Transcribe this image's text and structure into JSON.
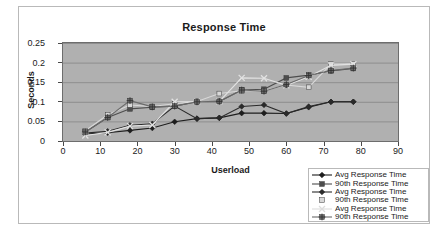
{
  "chart_data": {
    "type": "line",
    "title": "Response Time",
    "xlabel": "Userload",
    "ylabel": "Seconds",
    "xlim": [
      0,
      90
    ],
    "ylim": [
      0,
      0.25
    ],
    "xticks": [
      0,
      10,
      20,
      30,
      40,
      50,
      60,
      70,
      80,
      90
    ],
    "yticks": [
      0,
      0.05,
      0.1,
      0.15,
      0.2,
      0.25
    ],
    "ytick_labels": [
      "0",
      "0.05",
      "0.1",
      "0.15",
      "0.2",
      "0.25"
    ],
    "xtick_labels": [
      "0",
      "10",
      "20",
      "30",
      "40",
      "50",
      "60",
      "70",
      "80",
      "90"
    ],
    "grid": true,
    "plot_background": "#b0b0b0",
    "legend_position": "bottom-right",
    "x": [
      6,
      12,
      18,
      24,
      30,
      36,
      42,
      48,
      54,
      60,
      66,
      72,
      78
    ],
    "series": [
      {
        "name": "Avg Response Time",
        "marker": "diamond",
        "color": "#1d1d1d",
        "values": [
          0.018,
          0.021,
          0.027,
          0.033,
          0.049,
          0.057,
          0.059,
          0.071,
          0.071,
          0.07,
          0.086,
          0.1,
          0.1
        ]
      },
      {
        "name": "90th Response Time",
        "marker": "square",
        "color": "#4d4d4d",
        "values": [
          0.023,
          0.06,
          0.082,
          0.086,
          0.089,
          0.1,
          0.101,
          0.13,
          0.132,
          0.161,
          0.168,
          0.179,
          0.185
        ]
      },
      {
        "name": "Avg Response Time",
        "marker": "diamond",
        "color": "#2a2a2a",
        "values": [
          0.02,
          0.025,
          0.04,
          0.044,
          0.089,
          0.057,
          0.059,
          0.088,
          0.092,
          0.07,
          0.088,
          0.1,
          0.1
        ]
      },
      {
        "name": "90th Response Time",
        "marker": "square",
        "color": "#d8d8d8",
        "values": [
          0.026,
          0.067,
          0.092,
          0.088,
          0.095,
          0.101,
          0.121,
          0.128,
          0.128,
          0.143,
          0.137,
          0.196,
          0.197
        ]
      },
      {
        "name": "Avg Response Time",
        "marker": "cross",
        "color": "#e2e2e2",
        "values": [
          0.014,
          0.022,
          0.038,
          0.041,
          0.1,
          0.1,
          0.101,
          0.161,
          0.16,
          0.142,
          0.164,
          0.193,
          0.196
        ]
      },
      {
        "name": "90th Response Time",
        "marker": "square-cross",
        "color": "#6a6a6a",
        "values": [
          0.023,
          0.06,
          0.103,
          0.087,
          0.089,
          0.1,
          0.101,
          0.13,
          0.127,
          0.144,
          0.167,
          0.18,
          0.186
        ]
      }
    ]
  },
  "legend": {
    "entries": [
      {
        "label": "Avg Response Time",
        "marker": "diamond",
        "color": "#1d1d1d"
      },
      {
        "label": "90th Response Time",
        "marker": "square",
        "color": "#4d4d4d"
      },
      {
        "label": "Avg Response Time",
        "marker": "diamond",
        "color": "#2a2a2a"
      },
      {
        "label": "90th Response Time",
        "marker": "square",
        "color": "#d8d8d8"
      },
      {
        "label": "Avg Response Time",
        "marker": "cross",
        "color": "#dcdcdc"
      },
      {
        "label": "90th Response Time",
        "marker": "square-cross",
        "color": "#6a6a6a"
      }
    ]
  }
}
